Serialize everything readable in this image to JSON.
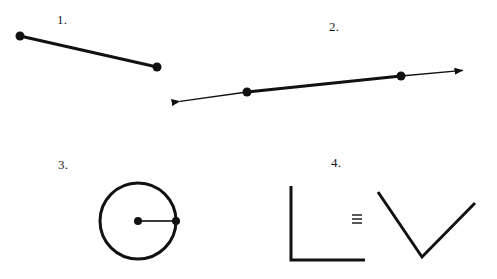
{
  "page": {
    "background_color": "#ffffff",
    "ink_color": "#111111",
    "width": 497,
    "height": 279
  },
  "figures": [
    {
      "id": "figure-1",
      "label": "1.",
      "label_position": {
        "x": 57,
        "y": 12
      },
      "kind": "line-segment",
      "description": "Line segment with two filled endpoint dots",
      "stroke_width": 3,
      "points": [
        {
          "name": "endpoint-left",
          "x": 20,
          "y": 36,
          "dot": true,
          "dot_radius": 4.5
        },
        {
          "name": "endpoint-right",
          "x": 157,
          "y": 67,
          "dot": true,
          "dot_radius": 4.5
        }
      ]
    },
    {
      "id": "figure-2",
      "label": "2.",
      "label_position": {
        "x": 329,
        "y": 19
      },
      "kind": "line-with-arrows",
      "description": "Line extending with arrowheads at both ends, two filled points marking an emphasized segment",
      "thin_stroke_width": 1.4,
      "thick_stroke_width": 3,
      "arrow_tips": [
        {
          "name": "arrow-tip-left",
          "x": 176,
          "y": 102
        },
        {
          "name": "arrow-tip-right",
          "x": 467,
          "y": 70
        }
      ],
      "points": [
        {
          "name": "point-left",
          "x": 247,
          "y": 92,
          "dot": true,
          "dot_radius": 4.5
        },
        {
          "name": "point-right",
          "x": 401,
          "y": 76,
          "dot": true,
          "dot_radius": 4.5
        }
      ]
    },
    {
      "id": "figure-3",
      "label": "3.",
      "label_position": {
        "x": 58,
        "y": 157
      },
      "kind": "circle-with-radius",
      "description": "Circle with center dot and radius segment drawn to a dot on the circumference",
      "circle_stroke_width": 3,
      "radius_stroke_width": 2,
      "center": {
        "name": "circle-center",
        "x": 138,
        "y": 221,
        "dot": true,
        "dot_radius": 4
      },
      "radius_length": 38,
      "radius_endpoint": {
        "name": "radius-endpoint",
        "x": 176,
        "y": 221,
        "dot": true,
        "dot_radius": 4
      }
    },
    {
      "id": "figure-4",
      "label": "4.",
      "label_position": {
        "x": 331,
        "y": 155
      },
      "kind": "congruent-angles",
      "description": "A right angle congruent to a V-shaped angle, joined by a congruence symbol",
      "stroke_width": 3,
      "relation_symbol": "≡",
      "relation_symbol_name": "congruence-symbol",
      "relation_symbol_position": {
        "x": 356,
        "y": 220
      },
      "left_angle": {
        "name": "right-angle",
        "vertex": {
          "x": 291,
          "y": 260
        },
        "ray_endpoints": [
          {
            "x": 291,
            "y": 186
          },
          {
            "x": 365,
            "y": 260
          }
        ]
      },
      "right_angle": {
        "name": "v-angle",
        "vertex": {
          "x": 422,
          "y": 257
        },
        "ray_endpoints": [
          {
            "x": 378,
            "y": 192
          },
          {
            "x": 475,
            "y": 203
          }
        ]
      }
    }
  ]
}
